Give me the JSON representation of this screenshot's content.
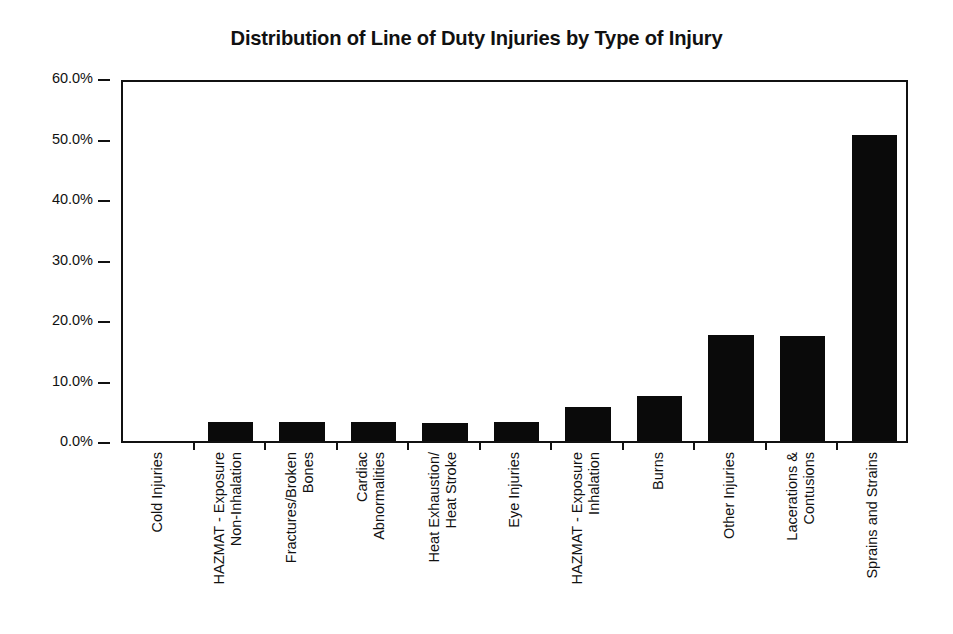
{
  "chart_data": {
    "type": "bar",
    "title": "Distribution of Line of Duty Injuries by Type of Injury",
    "xlabel": "",
    "ylabel": "",
    "ylim": [
      0,
      60
    ],
    "ytick_values": [
      60,
      50,
      40,
      30,
      20,
      10,
      0
    ],
    "ytick_labels": [
      "60.0%",
      "50.0%",
      "40.0%",
      "30.0%",
      "20.0%",
      "10.0%",
      "0.0%"
    ],
    "grid": false,
    "legend": "none",
    "bar_color": "#0a0a0a",
    "axis_color": "#111111",
    "background_color": "#ffffff",
    "categories": [
      "Cold Injuries",
      "HAZMAT - Exposure Non-Inhalation",
      "Fractures/Broken Bones",
      "Cardiac Abnormalities",
      "Heat Exhaustion/ Heat Stroke",
      "Eye Injuries",
      "HAZMAT - Exposure Inhalation",
      "Burns",
      "Other Injuries",
      "Lacerations & Contusions",
      "Sprains and Strains"
    ],
    "category_label_lines": [
      [
        "Cold Injuries"
      ],
      [
        "HAZMAT - Exposure",
        "Non-Inhalation"
      ],
      [
        "Fractures/Broken",
        "Bones"
      ],
      [
        "Cardiac",
        "Abnormalities"
      ],
      [
        "Heat Exhaustion/",
        "Heat Stroke"
      ],
      [
        "Eye Injuries"
      ],
      [
        "HAZMAT - Exposure",
        "Inhalation"
      ],
      [
        "Burns"
      ],
      [
        "Other Injuries"
      ],
      [
        "Lacerations &",
        "Contusions"
      ],
      [
        "Sprains and Strains"
      ]
    ],
    "values": [
      0.0,
      3.2,
      3.1,
      3.1,
      3.0,
      3.1,
      5.6,
      7.4,
      17.5,
      17.4,
      50.6
    ],
    "value_labels": [
      "0.0%",
      "3.2%",
      "3.1%",
      "3.1%",
      "3.0%",
      "3.1%",
      "5.6%",
      "7.4%",
      "17.5%",
      "17.4%",
      "50.6%"
    ]
  }
}
